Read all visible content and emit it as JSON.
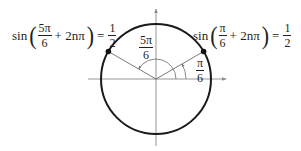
{
  "diagram": {
    "type": "unit-circle",
    "center": {
      "x": 156,
      "y": 79
    },
    "radius": 55,
    "colors": {
      "ink": "#231f20",
      "axis": "#8a8a8a",
      "circle": "#1a1a1a"
    }
  },
  "left_equation": {
    "fn": "sin",
    "angle_num": "5π",
    "angle_den": "6",
    "term": "+ 2nπ",
    "equals": "=",
    "result_num": "1",
    "result_den": "2"
  },
  "right_equation": {
    "fn": "sin",
    "angle_num": "π",
    "angle_den": "6",
    "term": "+ 2nπ",
    "equals": "=",
    "result_num": "1",
    "result_den": "2"
  },
  "angle_labels": {
    "large": {
      "num": "5π",
      "den": "6"
    },
    "small": {
      "num": "π",
      "den": "6"
    }
  }
}
